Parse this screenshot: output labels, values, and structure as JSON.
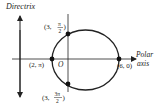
{
  "diagram": {
    "type": "polar-conic-ellipse",
    "labels": {
      "directrix": "Directrix",
      "polar_word": "Polar",
      "axis_word": "axis",
      "pole": "O"
    },
    "points": [
      {
        "id": "top",
        "label_pre": "(3, ",
        "num": "π",
        "den": "2",
        "label_post": ")"
      },
      {
        "id": "left",
        "label": "(2, π)"
      },
      {
        "id": "right",
        "label": "(6, 0)"
      },
      {
        "id": "bottom",
        "label_pre": "(3, ",
        "num": "3π",
        "den": "2",
        "label_post": ")"
      }
    ],
    "colors": {
      "stroke": "#222222",
      "point": "#111111"
    }
  }
}
